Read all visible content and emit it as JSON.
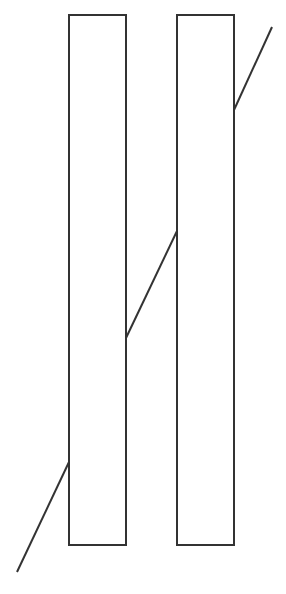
{
  "diagram": {
    "title": "",
    "stroke_color": "#333333",
    "background": "#ffffff",
    "rectangles": [
      {
        "name": "left-bar",
        "x": 69,
        "y": 15,
        "width": 57,
        "height": 530
      },
      {
        "name": "right-bar",
        "x": 177,
        "y": 15,
        "width": 57,
        "height": 530
      }
    ],
    "line_segments": [
      {
        "name": "lower-left-segment",
        "x1": 17,
        "y1": 572,
        "x2": 69,
        "y2": 462
      },
      {
        "name": "middle-segment",
        "x1": 126,
        "y1": 338,
        "x2": 177,
        "y2": 231
      },
      {
        "name": "upper-right-segment",
        "x1": 234,
        "y1": 110,
        "x2": 272,
        "y2": 27
      }
    ]
  }
}
